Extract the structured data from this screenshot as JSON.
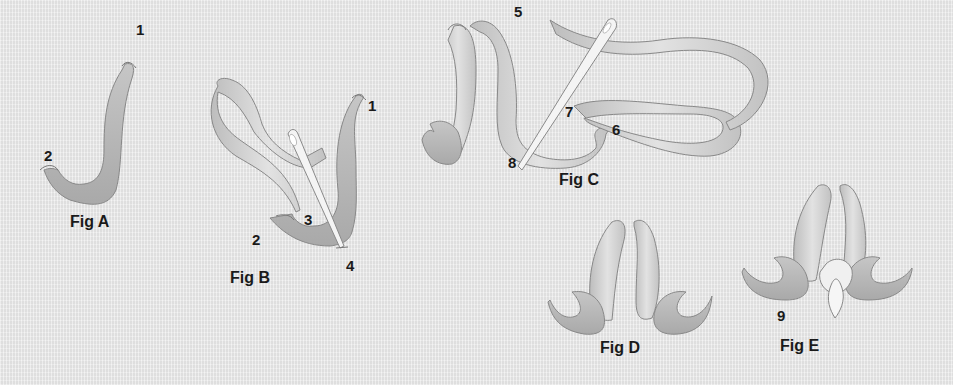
{
  "diagram": {
    "type": "ribbon-embroidery-stitch-steps",
    "colors": {
      "background": "#e8e8e8",
      "ribbon_light": "#dcdcdc",
      "ribbon_dark": "#b5b5b5",
      "ribbon_outline": "#8a8a8a",
      "needle": "#f2f2f2",
      "text": "#1a1a1a"
    },
    "figures": [
      {
        "id": "A",
        "caption": "Fig A",
        "points": [
          "1",
          "2"
        ]
      },
      {
        "id": "B",
        "caption": "Fig B",
        "points": [
          "1",
          "2",
          "3",
          "4"
        ]
      },
      {
        "id": "C",
        "caption": "Fig C",
        "points": [
          "5",
          "6",
          "7",
          "8"
        ]
      },
      {
        "id": "D",
        "caption": "Fig D",
        "points": []
      },
      {
        "id": "E",
        "caption": "Fig E",
        "points": [
          "9"
        ]
      }
    ]
  }
}
